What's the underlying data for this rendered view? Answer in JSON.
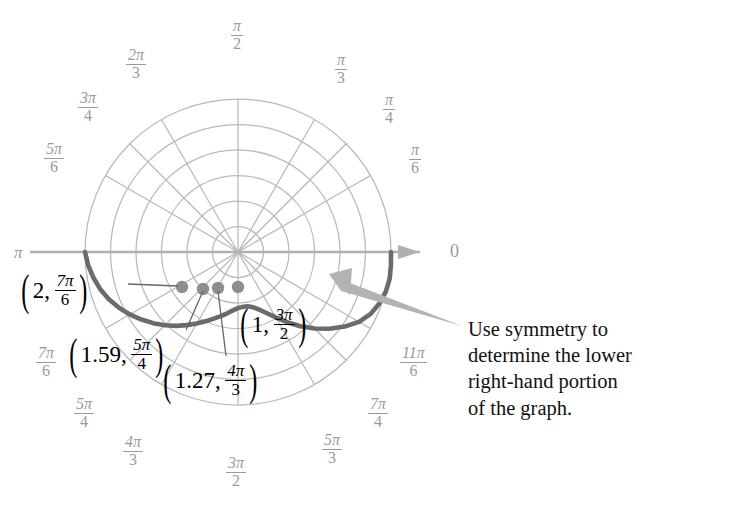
{
  "figure": {
    "type": "polar-graph",
    "axis_labels": {
      "zero": "0",
      "pi": "π"
    },
    "colors": {
      "curve": "#6b6b6b",
      "grid": "#b9b9b9",
      "axis": "#b0b0b0",
      "point": "#8e8e8e",
      "arrow": "#b3b3b3",
      "tick_text": "#9a9a9a",
      "label_text": "#111111"
    }
  },
  "angle_ticks": [
    {
      "id": "pi-over-2",
      "num": "π",
      "den": "2",
      "x": 231,
      "y": 18,
      "deg": 90
    },
    {
      "id": "2pi-over-3",
      "num": "2π",
      "den": "3",
      "x": 126,
      "y": 47,
      "deg": 120
    },
    {
      "id": "3pi-over-4",
      "num": "3π",
      "den": "4",
      "x": 78,
      "y": 90,
      "deg": 135
    },
    {
      "id": "5pi-over-6",
      "num": "5π",
      "den": "6",
      "x": 44,
      "y": 141,
      "deg": 150
    },
    {
      "id": "pi-over-3",
      "num": "π",
      "den": "3",
      "x": 335,
      "y": 52,
      "deg": 60
    },
    {
      "id": "pi-over-4",
      "num": "π",
      "den": "4",
      "x": 383,
      "y": 92,
      "deg": 45
    },
    {
      "id": "pi-over-6",
      "num": "π",
      "den": "6",
      "x": 409,
      "y": 142,
      "deg": 30
    },
    {
      "id": "7pi-over-6",
      "num": "7π",
      "den": "6",
      "x": 36,
      "y": 345,
      "deg": 210
    },
    {
      "id": "5pi-over-4",
      "num": "5π",
      "den": "4",
      "x": 74,
      "y": 396,
      "deg": 225
    },
    {
      "id": "4pi-over-3",
      "num": "4π",
      "den": "3",
      "x": 123,
      "y": 434,
      "deg": 240
    },
    {
      "id": "3pi-over-2",
      "num": "3π",
      "den": "2",
      "x": 226,
      "y": 455,
      "deg": 270
    },
    {
      "id": "5pi-over-3",
      "num": "5π",
      "den": "3",
      "x": 322,
      "y": 432,
      "deg": 300
    },
    {
      "id": "7pi-over-4",
      "num": "7π",
      "den": "4",
      "x": 368,
      "y": 396,
      "deg": 315
    },
    {
      "id": "11pi-over-6",
      "num": "11π",
      "den": "6",
      "x": 400,
      "y": 345,
      "deg": 330
    }
  ],
  "points": [
    {
      "id": "p-2-7pi-6",
      "r_text": "2",
      "theta_num": "7π",
      "theta_den": "6",
      "px": 182,
      "py": 287
    },
    {
      "id": "p-159-5pi-4",
      "r_text": "1.59",
      "theta_num": "5π",
      "theta_den": "4",
      "px": 203,
      "py": 289
    },
    {
      "id": "p-127-4pi-3",
      "r_text": "1.27",
      "theta_num": "4π",
      "theta_den": "3",
      "px": 218,
      "py": 288
    },
    {
      "id": "p-1-3pi-2",
      "r_text": "1",
      "theta_num": "3π",
      "theta_den": "2",
      "px": 238,
      "py": 287
    }
  ],
  "point_labels": [
    {
      "id": "label-2-7pi-6",
      "r_text": "2",
      "num": "7π",
      "den": "6",
      "x": 18,
      "y": 272
    },
    {
      "id": "label-1-3pi-2",
      "r_text": "1",
      "num": "3π",
      "den": "2",
      "x": 237,
      "y": 306
    },
    {
      "id": "label-159-5pi-4",
      "r_text": "1.59",
      "num": "5π",
      "den": "4",
      "x": 66,
      "y": 336
    },
    {
      "id": "label-127-4pi-3",
      "r_text": "1.27",
      "num": "4π",
      "den": "3",
      "x": 160,
      "y": 362
    }
  ],
  "annotation": {
    "id": "symmetry-note",
    "text": "Use symmetry to\ndetermine the lower\nright-hand portion\nof the graph.",
    "x": 468,
    "y": 316
  },
  "chart_data": {
    "type": "line",
    "title": "",
    "xlabel": "",
    "ylabel": "",
    "coordinate_system": "polar",
    "center_px": [
      238,
      252
    ],
    "radial_scale_px_per_unit": 51,
    "grid_circles_r": [
      0.5,
      1,
      1.5,
      2,
      2.5,
      3
    ],
    "angle_spokes_deg": [
      0,
      30,
      45,
      60,
      90,
      120,
      135,
      150,
      180,
      210,
      225,
      240,
      270,
      300,
      315,
      330
    ],
    "equation_note": "r = 1 - 2 sin(theta) limacon (upper portion drawn)",
    "labeled_points": [
      {
        "theta": "7pi/6",
        "theta_deg": 210,
        "r": 2
      },
      {
        "theta": "5pi/4",
        "theta_deg": 225,
        "r": 1.59
      },
      {
        "theta": "4pi/3",
        "theta_deg": 240,
        "r": 1.27
      },
      {
        "theta": "3pi/2",
        "theta_deg": 270,
        "r": 1
      }
    ],
    "curve_theta_deg": [
      180,
      185,
      190,
      195,
      200,
      205,
      210,
      215,
      220,
      225,
      230,
      235,
      240,
      245,
      250,
      255,
      260,
      265,
      270,
      275,
      280,
      285,
      290,
      295,
      300,
      305,
      310,
      315,
      320,
      325,
      330,
      335,
      340,
      345,
      350,
      355,
      360
    ],
    "curve_r": [
      3.0,
      2.95,
      2.88,
      2.8,
      2.7,
      2.58,
      2.45,
      2.31,
      2.17,
      2.03,
      1.89,
      1.75,
      1.62,
      1.5,
      1.39,
      1.3,
      1.22,
      1.15,
      1.1,
      1.08,
      1.08,
      1.12,
      1.2,
      1.32,
      1.48,
      1.68,
      1.9,
      2.12,
      2.34,
      2.55,
      2.74,
      2.87,
      2.95,
      3.0,
      3.02,
      3.01,
      3.0
    ]
  }
}
